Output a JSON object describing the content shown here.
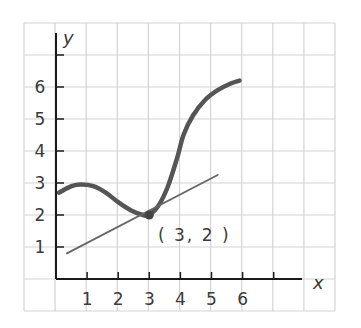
{
  "chart_data": {
    "type": "line",
    "title": "",
    "xlabel": "x",
    "ylabel": "y",
    "x_ticks": [
      "1",
      "2",
      "3",
      "4",
      "5",
      "6"
    ],
    "y_ticks": [
      "1",
      "2",
      "3",
      "4",
      "5",
      "6"
    ],
    "xlim": [
      0,
      7.5
    ],
    "ylim": [
      0,
      7
    ],
    "grid": true,
    "series": [
      {
        "name": "curve",
        "style": "thick",
        "color": "#555555",
        "x": [
          0.1,
          0.5,
          0.8,
          1.2,
          1.6,
          2.0,
          2.4,
          2.8,
          3.0,
          3.3,
          3.6,
          3.9,
          4.1,
          4.4,
          4.8,
          5.2,
          5.6,
          5.9
        ],
        "y": [
          2.7,
          2.9,
          2.95,
          2.9,
          2.7,
          2.4,
          2.15,
          2.0,
          2.0,
          2.3,
          2.9,
          3.8,
          4.5,
          5.1,
          5.6,
          5.9,
          6.1,
          6.2
        ]
      },
      {
        "name": "tangent-line",
        "style": "thin",
        "color": "#666666",
        "x": [
          0.35,
          5.2
        ],
        "y": [
          0.8,
          3.25
        ]
      }
    ],
    "points": [
      {
        "x": 3,
        "y": 2,
        "label": "( 3, 2 )"
      }
    ],
    "annotations": [
      "( 3, 2 )"
    ]
  },
  "colors": {
    "grid": "#d4d4d4",
    "axis": "#1a1a1a",
    "curve": "#555555",
    "tangent": "#666666",
    "text": "#3a3a3a"
  }
}
